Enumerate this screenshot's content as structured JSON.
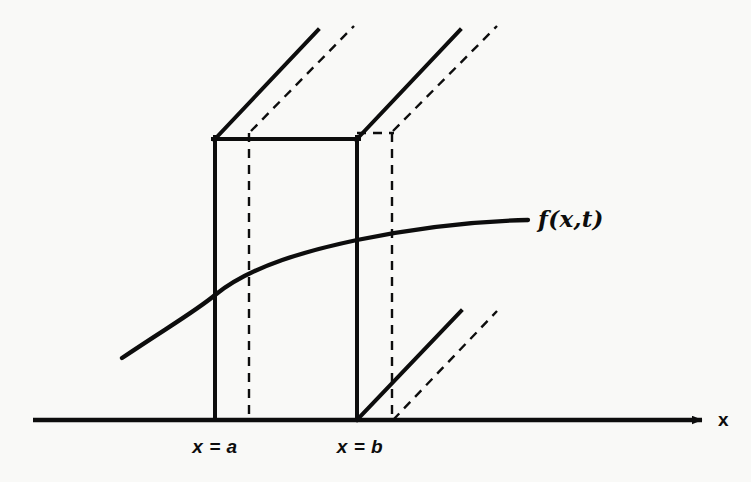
{
  "figure": {
    "title": "",
    "background_color": "#f9f9f7",
    "stroke_color": "#0d0d0d",
    "canvas": {
      "width": 751,
      "height": 482
    }
  },
  "axis": {
    "x_axis_label": "x",
    "x_axis_line": {
      "x1": 33,
      "y1": 420,
      "x2": 712,
      "y2": 420
    },
    "arrowhead": {
      "tip_x": 712,
      "tip_y": 420
    }
  },
  "tick_labels": [
    {
      "text": "x = a",
      "x": 215,
      "y": 452
    },
    {
      "text": "x = b",
      "x": 360,
      "y": 452
    }
  ],
  "curve": {
    "label": "f(x,t)",
    "label_x": 538,
    "label_y": 220,
    "points": [
      {
        "x": 122,
        "y": 358
      },
      {
        "x": 215,
        "y": 295
      },
      {
        "x": 280,
        "y": 266
      },
      {
        "x": 357,
        "y": 240
      },
      {
        "x": 440,
        "y": 225
      },
      {
        "x": 528,
        "y": 220
      }
    ]
  },
  "box": {
    "description": "open-topped rectangular control volume between x = a and x = b",
    "front_face": {
      "left_x": 215,
      "right_x": 357,
      "top_y": 139,
      "bottom_y": 420
    },
    "depth_offset": {
      "dx": 36,
      "dy": -8
    },
    "solid_edges": [
      {
        "name": "front-top-edge",
        "x1": 215,
        "y1": 139,
        "x2": 357,
        "y2": 139
      },
      {
        "name": "front-left-edge",
        "x1": 215,
        "y1": 139,
        "x2": 215,
        "y2": 420
      },
      {
        "name": "front-right-edge",
        "x1": 357,
        "y1": 139,
        "x2": 357,
        "y2": 420
      },
      {
        "name": "left-upper-diagonal",
        "x1": 215,
        "y1": 139,
        "x2": 318,
        "y2": 30
      },
      {
        "name": "right-upper-diagonal",
        "x1": 357,
        "y1": 139,
        "x2": 460,
        "y2": 30
      },
      {
        "name": "right-lower-diagonal",
        "x1": 357,
        "y1": 420,
        "x2": 461,
        "y2": 311
      }
    ],
    "dashed_edges": [
      {
        "name": "left-back-diagonal",
        "x1": 251,
        "y1": 131,
        "x2": 354,
        "y2": 26
      },
      {
        "name": "right-back-diagonal",
        "x1": 393,
        "y1": 131,
        "x2": 497,
        "y2": 26
      },
      {
        "name": "right-back-lower-diagonal",
        "x1": 393,
        "y1": 420,
        "x2": 497,
        "y2": 311
      },
      {
        "name": "left-back-vertical",
        "x1": 249,
        "y1": 133,
        "x2": 249,
        "y2": 420
      },
      {
        "name": "right-back-vertical",
        "x1": 392,
        "y1": 133,
        "x2": 392,
        "y2": 420
      },
      {
        "name": "back-top-edge",
        "x1": 357,
        "y1": 133,
        "x2": 392,
        "y2": 133
      }
    ]
  }
}
